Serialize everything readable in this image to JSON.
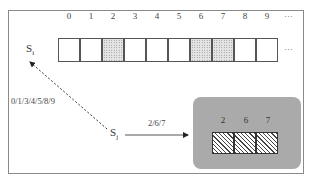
{
  "diagram": {
    "indices": [
      "0",
      "1",
      "2",
      "3",
      "4",
      "5",
      "6",
      "7",
      "8",
      "9"
    ],
    "ellipsis_top": "···",
    "ellipsis_row": "···",
    "cells": [
      {
        "index": "0",
        "fill": "empty"
      },
      {
        "index": "1",
        "fill": "empty"
      },
      {
        "index": "2",
        "fill": "dotted"
      },
      {
        "index": "3",
        "fill": "empty"
      },
      {
        "index": "4",
        "fill": "empty"
      },
      {
        "index": "5",
        "fill": "empty"
      },
      {
        "index": "6",
        "fill": "dotted"
      },
      {
        "index": "7",
        "fill": "dotted"
      },
      {
        "index": "8",
        "fill": "empty"
      },
      {
        "index": "9",
        "fill": "empty"
      }
    ],
    "node_i": {
      "base": "S",
      "sub": "i"
    },
    "node_j": {
      "base": "S",
      "sub": "j"
    },
    "dashed_edge_label": "0/1/3/4/5/8/9",
    "solid_edge_label": "2/6/7",
    "subset": {
      "indices": [
        "2",
        "6",
        "7"
      ],
      "fill": "hatched",
      "box_color": "#aaaaaa"
    }
  }
}
